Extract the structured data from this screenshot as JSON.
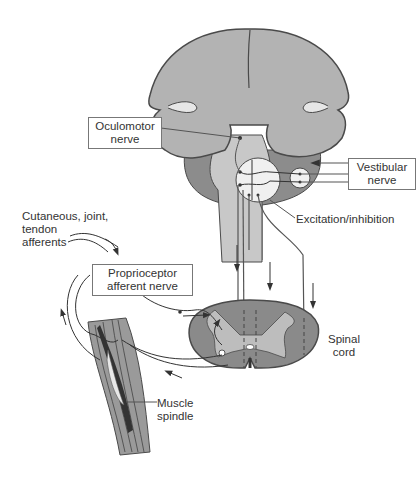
{
  "diagram": {
    "labels": {
      "oculomotor": [
        "Oculomotor",
        "nerve"
      ],
      "vestibular": [
        "Vestibular",
        "nerve"
      ],
      "excitation": "Excitation/inhibition",
      "cutaneous": [
        "Cutaneous, joint,",
        "tendon",
        "afferents"
      ],
      "proprioceptor": [
        "Proprioceptor",
        "afferent nerve"
      ],
      "spinal_cord": [
        "Spinal",
        "cord"
      ],
      "muscle_spindle": [
        "Muscle",
        "spindle"
      ]
    },
    "colors": {
      "brain_fill": "#b3b3b3",
      "brainstem_dark": "#8c8c8c",
      "brainstem_light": "#c8c8c8",
      "cord_dark": "#8a8a8a",
      "cord_light": "#b8b8b8",
      "outline": "#4a4a4a"
    }
  }
}
